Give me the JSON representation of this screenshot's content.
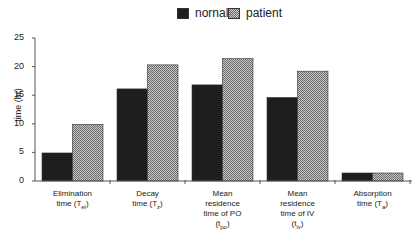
{
  "legend": {
    "items": [
      {
        "name": "normal",
        "label": "nornal",
        "color": "#1e1e1e"
      },
      {
        "name": "patient",
        "label": "patient",
        "color": "#9a9a9a"
      }
    ]
  },
  "axes": {
    "ylabel": "time (hr)",
    "yticks": [
      "0",
      "5",
      "10",
      "15",
      "20",
      "25"
    ]
  },
  "categories": [
    {
      "lines": [
        "Elimination",
        "time (T"
      ],
      "sub": "el",
      "suffix": ")"
    },
    {
      "lines": [
        "Decay",
        "time (T"
      ],
      "sub": "z",
      "suffix": ")"
    },
    {
      "lines": [
        "Mean",
        "residence",
        "time of PO",
        "(t"
      ],
      "sub": "po",
      "suffix": ")"
    },
    {
      "lines": [
        "Mean",
        "residence",
        "time of IV",
        "(t"
      ],
      "sub": "iv",
      "suffix": ")"
    },
    {
      "lines": [
        "Absorption",
        "time (T"
      ],
      "sub": "a",
      "suffix": ")"
    }
  ],
  "chart_data": {
    "type": "bar",
    "title": "",
    "xlabel": "",
    "ylabel": "time (hr)",
    "ylim": [
      0,
      25
    ],
    "yticks": [
      0,
      5,
      10,
      15,
      20,
      25
    ],
    "grid": false,
    "legend_position": "top",
    "categories": [
      "Elimination time (Tel)",
      "Decay time (Tz)",
      "Mean residence time of PO (tpo)",
      "Mean residence time of IV (tiv)",
      "Absorption time (Ta)"
    ],
    "series": [
      {
        "name": "nornal",
        "values": [
          4.9,
          16.1,
          16.8,
          14.6,
          1.4
        ]
      },
      {
        "name": "patient",
        "values": [
          9.9,
          20.3,
          21.4,
          19.2,
          1.4
        ]
      }
    ]
  }
}
